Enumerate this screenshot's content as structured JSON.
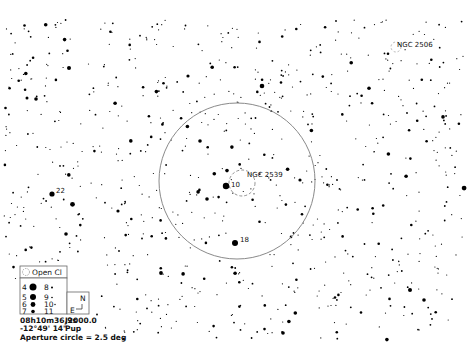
{
  "chart": {
    "epoch": "J2000.0",
    "center_ra": "08h10m36.9s",
    "center_dec": "-12°49' 14\"",
    "constellation": "Pup",
    "aperture_label": "Aperture circle = 2.5 deg",
    "aperture_deg": 2.5
  },
  "objects": [
    {
      "id": "ngc2539",
      "name": "NGC 2539",
      "type": "Open Cl"
    },
    {
      "id": "ngc2506",
      "name": "NGC 2506",
      "type": "Open Cl"
    }
  ],
  "star_labels": [
    {
      "id": "star-10",
      "label": "10"
    },
    {
      "id": "star-18",
      "label": "18"
    },
    {
      "id": "star-22",
      "label": "22"
    }
  ],
  "legend": {
    "object_type": "Open Cl",
    "magnitudes_left": [
      "4",
      "5",
      "6",
      "7"
    ],
    "magnitudes_right": [
      "8",
      "9",
      "10",
      "11"
    ],
    "compass_north": "N",
    "compass_east": "E"
  },
  "colors": {
    "background": "#ffffff",
    "star": "#000000",
    "aperture_circle": "#888888"
  }
}
